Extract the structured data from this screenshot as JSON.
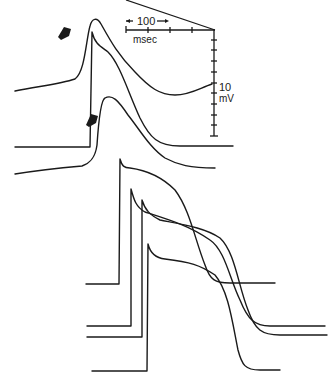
{
  "figure": {
    "type": "electrophysiology traces",
    "time_scale": {
      "value": "100",
      "unit": "msec",
      "divisions": 4
    },
    "voltage_scale": {
      "value": "10",
      "unit": "mV",
      "divisions": 10
    },
    "markers": [
      {
        "name": "arrow-1"
      },
      {
        "name": "arrow-2"
      }
    ],
    "traces": [
      {
        "name": "slow-response-trace-1"
      },
      {
        "name": "slow-response-trace-2"
      },
      {
        "name": "slow-response-trace-3"
      },
      {
        "name": "fast-action-potential-1"
      },
      {
        "name": "fast-action-potential-2"
      },
      {
        "name": "fast-action-potential-3"
      },
      {
        "name": "fast-action-potential-4"
      }
    ],
    "color": "#1a1a1a"
  }
}
